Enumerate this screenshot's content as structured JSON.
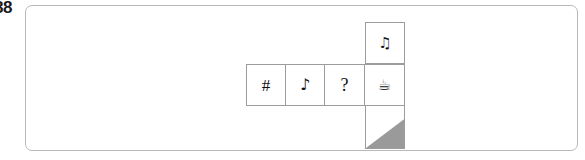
{
  "figure": {
    "number_label": "88"
  },
  "panel": {
    "border_color": "#b9b9b9",
    "background_color": "#ffffff"
  },
  "cube_net": {
    "description": "Unfolded cube net in a T/cross arrangement: one horizontal row of four square faces, with one face above and one face below the fourth (rightmost) square.",
    "cell_border_color": "#9c9c9c",
    "shade_color": "#9a9a9a",
    "faces": [
      {
        "position": "top",
        "icon_name": "beamed-music-note-icon",
        "glyph": "♫",
        "label": "beamed eighth notes"
      },
      {
        "position": "row-1",
        "icon_name": "number-sign-icon",
        "glyph": "#",
        "label": "number sign"
      },
      {
        "position": "row-2",
        "icon_name": "eighth-note-icon",
        "glyph": "♪",
        "label": "eighth note"
      },
      {
        "position": "row-3",
        "icon_name": "question-mark-icon",
        "glyph": "?",
        "label": "question mark"
      },
      {
        "position": "row-4",
        "icon_name": "hot-beverage-icon",
        "glyph": "☕",
        "label": "hot beverage cup"
      },
      {
        "position": "bottom",
        "icon_name": "shaded-triangle-icon",
        "glyph": "",
        "label": "shaded lower-right triangle"
      }
    ]
  }
}
